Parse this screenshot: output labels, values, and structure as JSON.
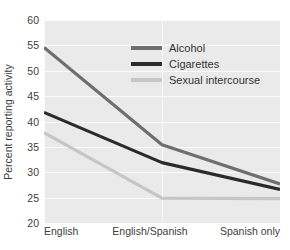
{
  "chart_data": {
    "type": "line",
    "title": "",
    "subtitle": "",
    "xlabel": "",
    "ylabel": "Percent reporting activity",
    "categories": [
      "English",
      "English/Spanish",
      "Spanish only"
    ],
    "series": [
      {
        "name": "Alcohol",
        "values": [
          54.6,
          35.4,
          27.7
        ],
        "color": "#6e6e6e"
      },
      {
        "name": "Cigarettes",
        "values": [
          41.8,
          31.9,
          26.6
        ],
        "color": "#2b2b2b"
      },
      {
        "name": "Sexual intercourse",
        "values": [
          37.8,
          24.9,
          24.8
        ],
        "color": "#c6c6c6"
      }
    ],
    "ylim": [
      20,
      60
    ],
    "ytick_values": [
      20,
      25,
      30,
      35,
      40,
      45,
      50,
      55,
      60
    ],
    "ytick_labels": [
      "20",
      "25",
      "30",
      "35",
      "40",
      "45",
      "50",
      "55",
      "60"
    ],
    "grid": true,
    "grid_color": "#fbfbfb",
    "plot_background": "#eaeaea",
    "legend_position": "inside-top-center"
  },
  "y_axis": {
    "title": "Percent reporting activity"
  },
  "legend": {
    "entries": [
      {
        "label": "Alcohol"
      },
      {
        "label": "Cigarettes"
      },
      {
        "label": "Sexual intercourse"
      }
    ]
  }
}
